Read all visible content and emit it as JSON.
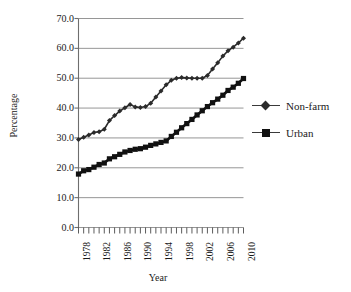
{
  "chart_data": {
    "type": "line",
    "title": "",
    "xlabel": "Year",
    "ylabel": "Percentage",
    "xlim": [
      1978,
      2010
    ],
    "ylim": [
      0.0,
      70.0
    ],
    "grid": true,
    "legend_position": "right",
    "ytick_labels": [
      "70.0",
      "60.0",
      "50.0",
      "40.0",
      "30.0",
      "20.0",
      "10.0",
      "0.0"
    ],
    "ytick_values": [
      70.0,
      60.0,
      50.0,
      40.0,
      30.0,
      20.0,
      10.0,
      0.0
    ],
    "xtick_labels": [
      "1978",
      "1982",
      "1986",
      "1990",
      "1994",
      "1998",
      "2002",
      "2006",
      "2010"
    ],
    "xtick_values": [
      1978,
      1982,
      1986,
      1990,
      1994,
      1998,
      2002,
      2006,
      2010
    ],
    "x": [
      1978,
      1979,
      1980,
      1981,
      1982,
      1983,
      1984,
      1985,
      1986,
      1987,
      1988,
      1989,
      1990,
      1991,
      1992,
      1993,
      1994,
      1995,
      1996,
      1997,
      1998,
      1999,
      2000,
      2001,
      2002,
      2003,
      2004,
      2005,
      2006,
      2007,
      2008,
      2009,
      2010
    ],
    "series": [
      {
        "name": "Non-farm",
        "marker": "diamond",
        "color": "#2b2b2b",
        "values": [
          29.5,
          30.2,
          31.0,
          31.8,
          32.1,
          32.9,
          35.8,
          37.5,
          39.0,
          40.1,
          41.2,
          40.4,
          40.2,
          40.5,
          41.6,
          43.7,
          45.7,
          47.8,
          49.3,
          50.0,
          50.2,
          50.1,
          50.0,
          50.0,
          50.0,
          50.9,
          53.1,
          55.2,
          57.4,
          59.2,
          60.4,
          61.8,
          63.4
        ]
      },
      {
        "name": "Urban",
        "marker": "square",
        "color": "#111111",
        "values": [
          17.9,
          19.0,
          19.4,
          20.2,
          21.1,
          21.6,
          23.0,
          23.7,
          24.5,
          25.3,
          25.8,
          26.2,
          26.4,
          26.9,
          27.5,
          28.0,
          28.5,
          29.0,
          30.5,
          31.9,
          33.4,
          34.8,
          36.2,
          37.7,
          39.1,
          40.5,
          41.8,
          43.0,
          44.3,
          45.9,
          47.0,
          48.3,
          49.9
        ]
      }
    ]
  },
  "legend": {
    "items": [
      {
        "label": "Non-farm"
      },
      {
        "label": "Urban"
      }
    ]
  }
}
